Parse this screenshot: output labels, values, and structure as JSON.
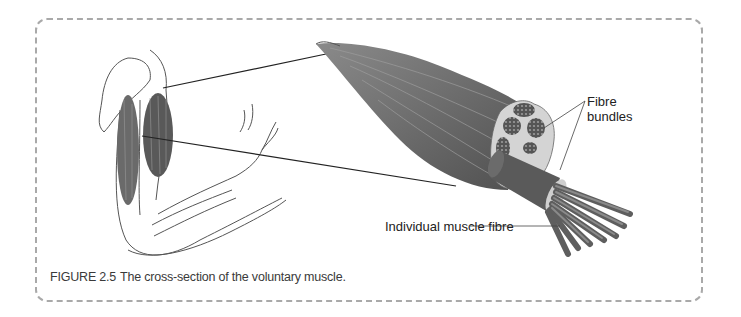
{
  "figure": {
    "number": "FIGURE 2.5",
    "caption": "The cross-section of the voluntary muscle.",
    "labels": {
      "fibre_bundles_line1": "Fibre",
      "fibre_bundles_line2": "bundles",
      "individual_fibre": "Individual muscle fibre"
    }
  },
  "colors": {
    "frame_border": "#a9a9a9",
    "muscle_dark": "#5e5e5e",
    "muscle_mid": "#7a7a7a",
    "sheath": "#cfcfcf"
  }
}
